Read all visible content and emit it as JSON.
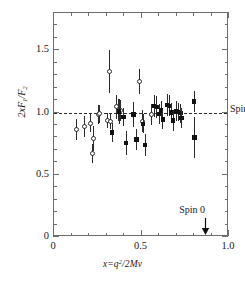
{
  "figure": {
    "type": "scatter-with-errorbars",
    "background": "#ffffff",
    "frame_color": "#6e6e6e",
    "marker_color": "#111111"
  },
  "axes": {
    "x": {
      "title_parts": {
        "var": "x",
        "eq": "=",
        "q": "q",
        "exp": "2",
        "slash": "/2",
        "M": "M",
        "nu": "ν"
      },
      "title_text": "x=q²/2Mν",
      "major_ticks": [
        "0",
        "0.5",
        "1.0"
      ],
      "major_values": [
        0,
        0.5,
        1.0
      ],
      "minor_values": [
        0.1,
        0.2,
        0.3,
        0.4,
        0.6,
        0.7,
        0.8,
        0.9
      ],
      "min": 0,
      "max": 1.0
    },
    "y": {
      "title_parts": {
        "two": "2",
        "x": "x",
        "F": "F",
        "one": "1",
        "slash": "/",
        "F2": "F",
        "two2": "2"
      },
      "title_text": "2xF₁/F₂",
      "major_ticks": [
        "0",
        "0.5",
        "1.0",
        "1.5"
      ],
      "major_values": [
        0,
        0.5,
        1.0,
        1.5
      ],
      "minor_values": [
        0.1,
        0.2,
        0.3,
        0.4,
        0.6,
        0.7,
        0.8,
        0.9,
        1.1,
        1.2,
        1.3,
        1.4,
        1.6,
        1.7
      ],
      "min": 0,
      "max": 1.8
    }
  },
  "annotations": {
    "spin_half": {
      "label": "Spin",
      "fraction_numerator": "1",
      "fraction_denominator": "2",
      "line_y": 1.0,
      "line_style": "dashed"
    },
    "spin_zero": {
      "label": "Spin 0",
      "arrow_x": 0.87,
      "arrow_to_y": 0.0
    }
  },
  "chart_data": {
    "type": "scatter",
    "title": "",
    "xlabel": "x=q²/2Mν",
    "ylabel": "2xF₁/F₂",
    "xlim": [
      0,
      1.0
    ],
    "ylim": [
      0,
      1.8
    ],
    "grid": false,
    "legend": null,
    "reference_lines": [
      {
        "y": 1.0,
        "style": "dashed",
        "label": "Spin 1/2"
      }
    ],
    "series": [
      {
        "name": "open-circles",
        "marker": "open-circle",
        "points": [
          {
            "x": 0.128,
            "y": 0.865,
            "yerr": 0.085
          },
          {
            "x": 0.172,
            "y": 0.885,
            "yerr": 0.085
          },
          {
            "x": 0.21,
            "y": 0.915,
            "yerr": 0.075
          },
          {
            "x": 0.218,
            "y": 0.67,
            "yerr": 0.075
          },
          {
            "x": 0.225,
            "y": 0.79,
            "yerr": 0.1
          },
          {
            "x": 0.252,
            "y": 0.985,
            "yerr": 0.075
          },
          {
            "x": 0.262,
            "y": 0.99,
            "yerr": 0.07
          },
          {
            "x": 0.305,
            "y": 0.935,
            "yerr": 0.06
          },
          {
            "x": 0.318,
            "y": 1.33,
            "yerr": 0.175
          },
          {
            "x": 0.322,
            "y": 0.925,
            "yerr": 0.06
          },
          {
            "x": 0.355,
            "y": 1.045,
            "yerr": 0.095
          },
          {
            "x": 0.368,
            "y": 1.02,
            "yerr": 0.085
          },
          {
            "x": 0.378,
            "y": 1.015,
            "yerr": 0.085
          },
          {
            "x": 0.488,
            "y": 1.25,
            "yerr": 0.1
          },
          {
            "x": 0.508,
            "y": 0.93,
            "yerr": 0.09
          },
          {
            "x": 0.555,
            "y": 0.985,
            "yerr": 0.085
          }
        ]
      },
      {
        "name": "filled-squares",
        "marker": "filled-square",
        "points": [
          {
            "x": 0.332,
            "y": 0.84,
            "yerr": 0.075
          },
          {
            "x": 0.372,
            "y": 1.01,
            "yerr": 0.1
          },
          {
            "x": 0.398,
            "y": 0.965,
            "yerr": 0.075
          },
          {
            "x": 0.412,
            "y": 0.755,
            "yerr": 0.095
          },
          {
            "x": 0.455,
            "y": 0.985,
            "yerr": 0.1
          },
          {
            "x": 0.472,
            "y": 0.785,
            "yerr": 0.085
          },
          {
            "x": 0.51,
            "y": 0.91,
            "yerr": 0.075
          },
          {
            "x": 0.52,
            "y": 0.74,
            "yerr": 0.09
          },
          {
            "x": 0.572,
            "y": 1.055,
            "yerr": 0.09
          },
          {
            "x": 0.588,
            "y": 1.045,
            "yerr": 0.085
          },
          {
            "x": 0.6,
            "y": 0.99,
            "yerr": 0.08
          },
          {
            "x": 0.612,
            "y": 1.015,
            "yerr": 0.075
          },
          {
            "x": 0.622,
            "y": 0.945,
            "yerr": 0.08
          },
          {
            "x": 0.648,
            "y": 1.06,
            "yerr": 0.09
          },
          {
            "x": 0.662,
            "y": 1.055,
            "yerr": 0.085
          },
          {
            "x": 0.672,
            "y": 1.0,
            "yerr": 0.08
          },
          {
            "x": 0.68,
            "y": 0.935,
            "yerr": 0.085
          },
          {
            "x": 0.7,
            "y": 1.01,
            "yerr": 0.08
          },
          {
            "x": 0.712,
            "y": 1.005,
            "yerr": 0.075
          },
          {
            "x": 0.722,
            "y": 0.995,
            "yerr": 0.075
          },
          {
            "x": 0.728,
            "y": 0.955,
            "yerr": 0.08
          },
          {
            "x": 0.8,
            "y": 1.09,
            "yerr": 0.085
          },
          {
            "x": 0.802,
            "y": 0.8,
            "yerr": 0.165
          }
        ]
      }
    ]
  }
}
